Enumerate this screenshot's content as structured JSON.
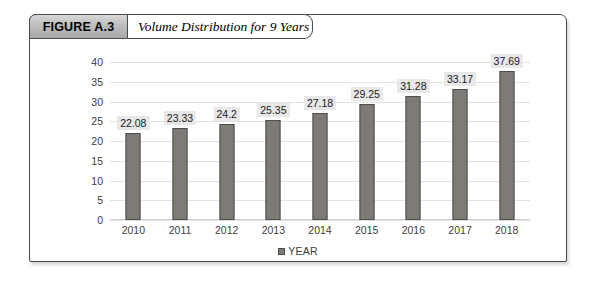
{
  "figure": {
    "tab_label": "FIGURE A.3",
    "caption": "Volume Distribution for 9 Years"
  },
  "legend": {
    "label": "YEAR",
    "swatch_color": "#7e7b76"
  },
  "colors": {
    "bar_fill": "#7e7b76",
    "bar_stroke": "#4f4d4a",
    "label_box": "#e8e8e8",
    "gridline": "#e2e2e2",
    "frame": "#4a4a4a"
  },
  "chart_data": {
    "type": "bar",
    "title": "Volume Distribution for 9 Years",
    "xlabel": "",
    "ylabel": "",
    "categories": [
      "2010",
      "2011",
      "2012",
      "2013",
      "2014",
      "2015",
      "2016",
      "2017",
      "2018"
    ],
    "values": [
      22.08,
      23.33,
      24.2,
      25.35,
      27.18,
      29.25,
      31.28,
      33.17,
      37.69
    ],
    "data_labels": [
      "22.08",
      "23.33",
      "24.2",
      "25.35",
      "27.18",
      "29.25",
      "31.28",
      "33.17",
      "37.69"
    ],
    "yticks": [
      0,
      5,
      10,
      15,
      20,
      25,
      30,
      35,
      40
    ],
    "ytick_labels": [
      "0",
      "5",
      "10",
      "15",
      "20",
      "25",
      "30",
      "35",
      "40"
    ],
    "ylim": [
      0,
      40
    ],
    "grid": true,
    "legend": [
      "YEAR"
    ],
    "legend_position": "bottom"
  }
}
